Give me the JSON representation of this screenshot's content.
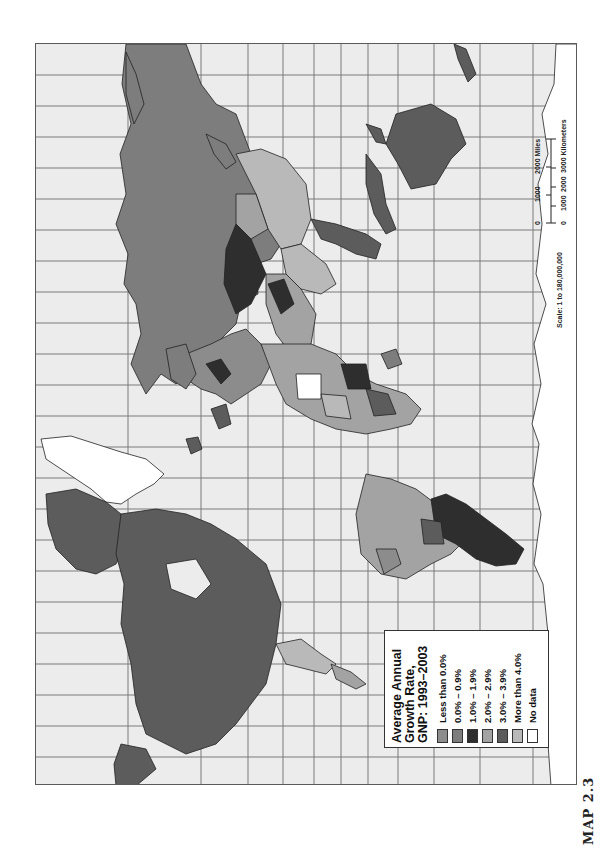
{
  "map": {
    "orientation": "rotated 90 degrees (north to the left)",
    "projection": "Mercator-style world map with graticule",
    "frame_background": "#ececec",
    "grid_color": "#7a7a7a"
  },
  "legend": {
    "title_line1": "Average Annual",
    "title_line2": "Growth Rate,",
    "title_line3": "GNP: 1993–2003",
    "items": [
      {
        "label": "Less than 0.0%",
        "color": "#8c8c8c"
      },
      {
        "label": "0.0% – 0.9%",
        "color": "#7d7d7d"
      },
      {
        "label": "1.0% – 1.9%",
        "color": "#2e2e2e"
      },
      {
        "label": "2.0% – 2.9%",
        "color": "#a3a3a3"
      },
      {
        "label": "3.0% – 3.9%",
        "color": "#5c5c5c"
      },
      {
        "label": "More than 4.0%",
        "color": "#b9b9b9"
      },
      {
        "label": "No data",
        "color": "#ffffff"
      }
    ]
  },
  "scale": {
    "ratio": "Scale: 1 to 180,000,000",
    "miles_ticks": [
      "0",
      "1000",
      "2000 Miles"
    ],
    "km_ticks": [
      "0",
      "1000",
      "2000",
      "3000 Kilometers"
    ]
  },
  "caption": {
    "map_number": "MAP 2.3"
  },
  "regions": [
    {
      "name": "North America (Canada, USA)",
      "category": "3.0% – 3.9%"
    },
    {
      "name": "Greenland",
      "category": "No data"
    },
    {
      "name": "Mexico / Central America",
      "category": "More than 4.0%"
    },
    {
      "name": "South America (Brazil)",
      "category": "More than 4.0%"
    },
    {
      "name": "Argentina / Southern Cone",
      "category": "1.0% – 1.9%"
    },
    {
      "name": "Russia",
      "category": "0.0% – 0.9%"
    },
    {
      "name": "China",
      "category": "More than 4.0%"
    },
    {
      "name": "Kazakhstan / Central Asia",
      "category": "1.0% – 1.9%"
    },
    {
      "name": "Australia",
      "category": "3.0% – 3.9%"
    },
    {
      "name": "Africa (mixed)",
      "category": "mixed"
    },
    {
      "name": "Europe (mixed)",
      "category": "mixed"
    },
    {
      "name": "Antarctica edge",
      "category": "No data"
    }
  ]
}
